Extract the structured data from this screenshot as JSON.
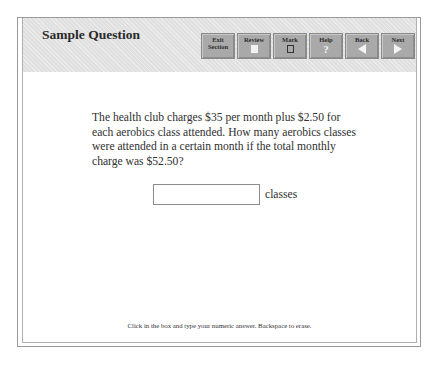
{
  "header": {
    "title": "Sample Question",
    "buttons": [
      {
        "label_line1": "Exit",
        "label_line2": "Section",
        "icon": "none"
      },
      {
        "label_line1": "Review",
        "icon": "document-icon"
      },
      {
        "label_line1": "Mark",
        "icon": "checkbox-icon"
      },
      {
        "label_line1": "Help",
        "icon": "question-icon",
        "glyph": "?"
      },
      {
        "label_line1": "Back",
        "icon": "arrow-left-icon"
      },
      {
        "label_line1": "Next",
        "icon": "arrow-right-icon"
      }
    ]
  },
  "question": {
    "text": "The health club charges $35 per month plus $2.50 for each aerobics class attended. How many aerobics classes were attended in a certain month if the total monthly charge was $52.50?",
    "answer_value": "",
    "answer_unit": "classes"
  },
  "footer": {
    "instructions": "Click in the box and type your numeric answer. Backspace to erase."
  },
  "colors": {
    "header_bg": "#e4e4e4",
    "button_bg": "#a9a9a9",
    "text": "#2f2f2f"
  }
}
